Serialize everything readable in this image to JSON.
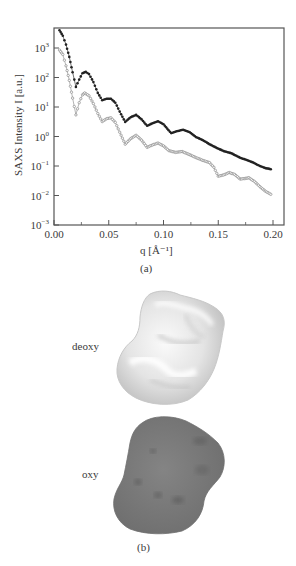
{
  "chart_data": {
    "type": "scatter",
    "title": "",
    "xlabel": "q [Å⁻¹]",
    "ylabel": "SAXS Intensity I [a.u.]",
    "xscale": "linear",
    "yscale": "log",
    "xlim": [
      0.0,
      0.21
    ],
    "ylim": [
      0.001,
      5000
    ],
    "grid": false,
    "legend": "none",
    "x_ticks": [
      "0.00",
      "0.05",
      "0.10",
      "0.15",
      "0.20"
    ],
    "x_tick_values": [
      0.0,
      0.05,
      0.1,
      0.15,
      0.2
    ],
    "y_ticks": [
      {
        "base": "10",
        "exp": "3",
        "value": 1000
      },
      {
        "base": "10",
        "exp": "2",
        "value": 100
      },
      {
        "base": "10",
        "exp": "1",
        "value": 10
      },
      {
        "base": "10",
        "exp": "0",
        "value": 1
      },
      {
        "base": "10",
        "exp": "−1",
        "value": 0.1
      },
      {
        "base": "10",
        "exp": "−2",
        "value": 0.01
      },
      {
        "base": "10",
        "exp": "−3",
        "value": 0.001
      }
    ],
    "series": [
      {
        "name": "deoxy",
        "color": "#222222",
        "marker": "filled-dot",
        "points": [
          [
            0.005,
            4000
          ],
          [
            0.008,
            2600
          ],
          [
            0.011,
            1300
          ],
          [
            0.014,
            500
          ],
          [
            0.017,
            150
          ],
          [
            0.02,
            48
          ],
          [
            0.023,
            85
          ],
          [
            0.026,
            140
          ],
          [
            0.029,
            155
          ],
          [
            0.032,
            130
          ],
          [
            0.036,
            70
          ],
          [
            0.04,
            30
          ],
          [
            0.044,
            17
          ],
          [
            0.048,
            19
          ],
          [
            0.052,
            19
          ],
          [
            0.056,
            14
          ],
          [
            0.06,
            7
          ],
          [
            0.065,
            3.1
          ],
          [
            0.07,
            4.5
          ],
          [
            0.075,
            5.4
          ],
          [
            0.08,
            3.8
          ],
          [
            0.085,
            2.3
          ],
          [
            0.09,
            2.8
          ],
          [
            0.095,
            3.3
          ],
          [
            0.1,
            2.6
          ],
          [
            0.107,
            1.3
          ],
          [
            0.112,
            1.5
          ],
          [
            0.118,
            1.7
          ],
          [
            0.124,
            1.4
          ],
          [
            0.13,
            0.95
          ],
          [
            0.136,
            0.75
          ],
          [
            0.142,
            0.55
          ],
          [
            0.148,
            0.42
          ],
          [
            0.155,
            0.32
          ],
          [
            0.162,
            0.27
          ],
          [
            0.17,
            0.19
          ],
          [
            0.176,
            0.16
          ],
          [
            0.182,
            0.13
          ],
          [
            0.188,
            0.1
          ],
          [
            0.193,
            0.085
          ],
          [
            0.198,
            0.078
          ]
        ]
      },
      {
        "name": "oxy",
        "color": "#8a8a8a",
        "marker": "open-dot",
        "points": [
          [
            0.005,
            850
          ],
          [
            0.008,
            600
          ],
          [
            0.011,
            250
          ],
          [
            0.014,
            80
          ],
          [
            0.017,
            20
          ],
          [
            0.02,
            5.4
          ],
          [
            0.023,
            14
          ],
          [
            0.026,
            26
          ],
          [
            0.028,
            30
          ],
          [
            0.032,
            24
          ],
          [
            0.036,
            13
          ],
          [
            0.04,
            6
          ],
          [
            0.044,
            3.2
          ],
          [
            0.048,
            4.0
          ],
          [
            0.052,
            4.3
          ],
          [
            0.056,
            3.0
          ],
          [
            0.06,
            1.4
          ],
          [
            0.065,
            0.55
          ],
          [
            0.07,
            0.85
          ],
          [
            0.075,
            1.1
          ],
          [
            0.08,
            0.75
          ],
          [
            0.085,
            0.43
          ],
          [
            0.09,
            0.52
          ],
          [
            0.095,
            0.6
          ],
          [
            0.1,
            0.48
          ],
          [
            0.105,
            0.33
          ],
          [
            0.111,
            0.29
          ],
          [
            0.117,
            0.31
          ],
          [
            0.123,
            0.25
          ],
          [
            0.13,
            0.19
          ],
          [
            0.136,
            0.155
          ],
          [
            0.142,
            0.13
          ],
          [
            0.146,
            0.09
          ],
          [
            0.15,
            0.045
          ],
          [
            0.155,
            0.05
          ],
          [
            0.16,
            0.06
          ],
          [
            0.165,
            0.052
          ],
          [
            0.17,
            0.036
          ],
          [
            0.175,
            0.038
          ],
          [
            0.178,
            0.04
          ],
          [
            0.183,
            0.03
          ],
          [
            0.188,
            0.02
          ],
          [
            0.193,
            0.014
          ],
          [
            0.198,
            0.011
          ]
        ]
      }
    ],
    "panel_label": "(a)"
  },
  "panel_b": {
    "label": "(b)",
    "models": [
      {
        "name": "deoxy",
        "label": "deoxy",
        "color": "#e6e6e6"
      },
      {
        "name": "oxy",
        "label": "oxy",
        "color": "#7a7a7a"
      }
    ]
  }
}
